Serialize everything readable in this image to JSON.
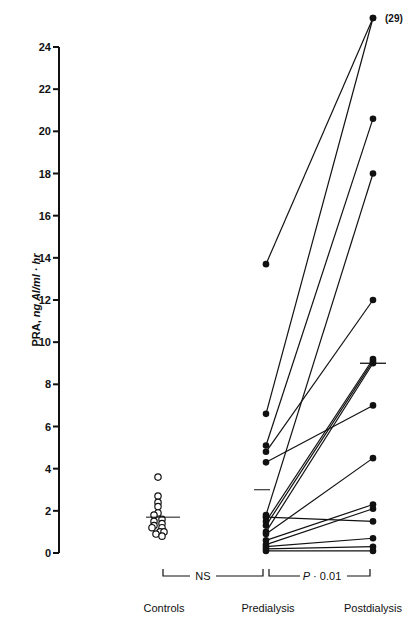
{
  "chart_data": {
    "type": "scatter",
    "title": "",
    "xlabel": "",
    "ylabel": {
      "prefix": "PRA, ",
      "units": "ng AI/ml · hr"
    },
    "ylim": [
      0,
      24
    ],
    "yticks": [
      0,
      2,
      4,
      6,
      8,
      10,
      12,
      14,
      16,
      18,
      20,
      22,
      24
    ],
    "grid": false,
    "categories": [
      "Controls",
      "Predialysis",
      "Postdialysis"
    ],
    "controls": {
      "marker": "open-circle",
      "values": [
        3.6,
        2.7,
        2.4,
        2.2,
        1.9,
        1.8,
        1.6,
        1.5,
        1.4,
        1.3,
        1.2,
        1.2,
        1.0,
        1.0,
        0.9,
        0.8
      ],
      "mean": 1.7
    },
    "paired": {
      "marker": "filled-circle",
      "pairs": [
        {
          "pre": 13.7,
          "post": 29,
          "post_label": "(29)"
        },
        {
          "pre": 6.6,
          "post": 24.2
        },
        {
          "pre": 5.1,
          "post": 20.6
        },
        {
          "pre": 1.8,
          "post": 18.0
        },
        {
          "pre": 4.8,
          "post": 12.0
        },
        {
          "pre": 1.5,
          "post": 9.2
        },
        {
          "pre": 1.3,
          "post": 9.1
        },
        {
          "pre": 1.0,
          "post": 9.0
        },
        {
          "pre": 4.3,
          "post": 7.0
        },
        {
          "pre": 0.9,
          "post": 4.5
        },
        {
          "pre": 0.6,
          "post": 2.3
        },
        {
          "pre": 0.4,
          "post": 2.1
        },
        {
          "pre": 1.7,
          "post": 1.5
        },
        {
          "pre": 0.3,
          "post": 0.7
        },
        {
          "pre": 0.2,
          "post": 0.3
        },
        {
          "pre": 0.1,
          "post": 0.1
        }
      ],
      "pre_mean": 3.0,
      "post_mean": 9.0
    },
    "comparisons": [
      {
        "from": "Controls",
        "to": "Predialysis",
        "label": "NS"
      },
      {
        "from": "Predialysis",
        "to": "Postdialysis",
        "label_prefix": "P",
        "label_op": " · ",
        "label_value": "0.01"
      }
    ]
  }
}
